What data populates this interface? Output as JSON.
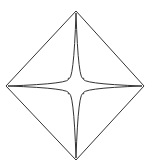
{
  "figure": {
    "name": "diamond-with-inscribed-four-pointed-star",
    "background_color": "#ffffff",
    "stroke_color": "#333333",
    "stroke_width": 1,
    "fill": "none",
    "canvas": {
      "width": 159,
      "height": 168
    },
    "center": {
      "x": 76,
      "y": 86
    },
    "diamond": {
      "name": "rhombus-outline",
      "vertices": [
        {
          "label": "top",
          "x": 76,
          "y": 11
        },
        {
          "label": "right",
          "x": 144,
          "y": 86
        },
        {
          "label": "bottom",
          "x": 76,
          "y": 160
        },
        {
          "label": "left",
          "x": 6,
          "y": 86
        }
      ],
      "horizontal_diagonal": 138,
      "vertical_diagonal": 149
    },
    "star": {
      "name": "four-pointed-star",
      "points": 4,
      "tips": [
        {
          "label": "top",
          "x": 76,
          "y": 13
        },
        {
          "label": "right",
          "x": 142,
          "y": 86
        },
        {
          "label": "bottom",
          "x": 76,
          "y": 158
        },
        {
          "label": "left",
          "x": 8,
          "y": 86
        }
      ],
      "inner_radius": 11,
      "arm_half_width_at_base": 5,
      "concavity": "arms curve inward (concave) between tips"
    }
  }
}
